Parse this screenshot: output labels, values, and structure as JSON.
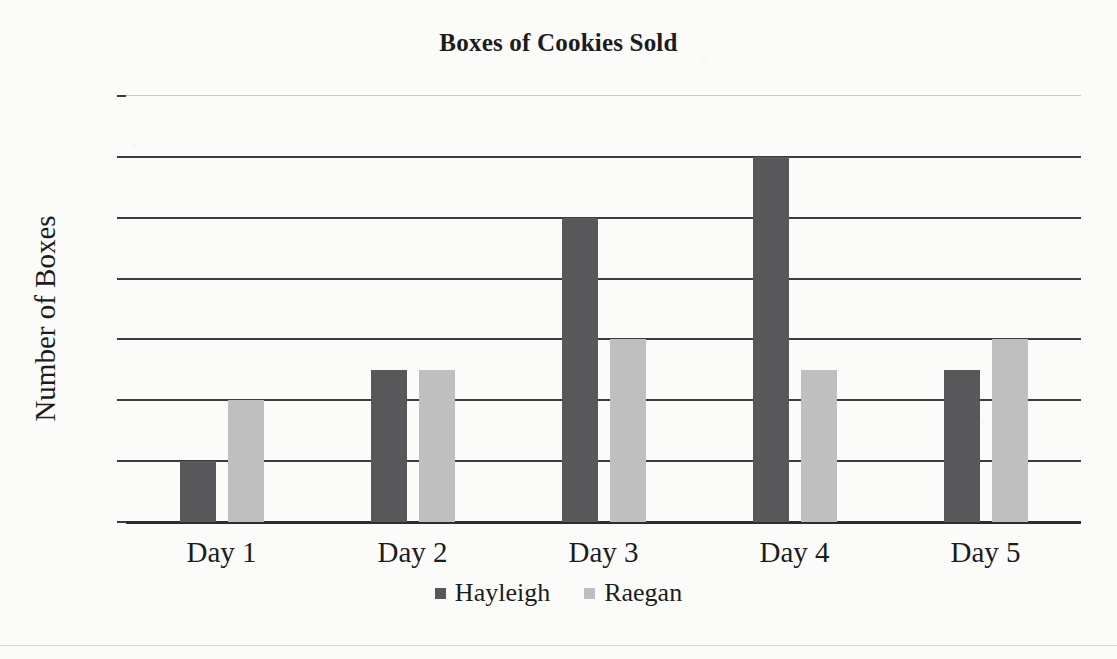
{
  "chart_data": {
    "type": "bar",
    "title": "Boxes of Cookies Sold",
    "xlabel": "",
    "ylabel": "Number of Boxes",
    "categories": [
      "Day 1",
      "Day 2",
      "Day 3",
      "Day 4",
      "Day 5"
    ],
    "series": [
      {
        "name": "Hayleigh",
        "color": "#58585a",
        "values": [
          2,
          5,
          10,
          12,
          5
        ]
      },
      {
        "name": "Raegan",
        "color": "#bfbfbf",
        "values": [
          4,
          5,
          6,
          5,
          6
        ]
      }
    ],
    "ylim": [
      0,
      14
    ],
    "y_ticks": [
      0,
      2,
      4,
      6,
      8,
      10,
      12,
      14
    ],
    "grid": true,
    "legend_position": "bottom"
  },
  "style": {
    "background": "#fbfbfa",
    "text_color": "#1c1c1c",
    "gridline_color": "#3c3c3c",
    "faint_gridline_color": "#c9c9c9"
  }
}
